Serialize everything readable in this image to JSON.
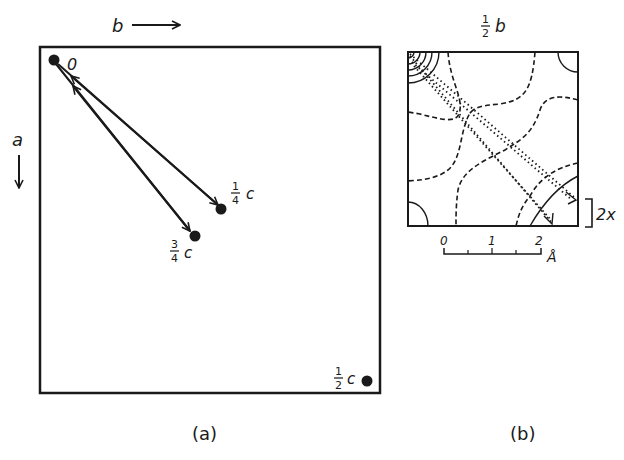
{
  "panel_a": {
    "caption": "(a)",
    "axis_b_label": "b",
    "axis_a_label": "a",
    "origin_label": "0",
    "points": [
      {
        "num": "1",
        "den": "4",
        "sym": "c"
      },
      {
        "num": "3",
        "den": "4",
        "sym": "c"
      },
      {
        "num": "1",
        "den": "2",
        "sym": "c"
      }
    ]
  },
  "panel_b": {
    "caption": "(b)",
    "top_label": {
      "num": "1",
      "den": "2",
      "sym": "b"
    },
    "side_label": "2x",
    "scale": {
      "ticks": [
        "0",
        "1",
        "2"
      ],
      "unit": "Å"
    }
  }
}
